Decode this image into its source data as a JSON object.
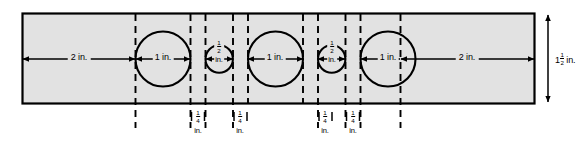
{
  "figure": {
    "type": "engineering-dimension-drawing",
    "plate": {
      "height_label_value": "1",
      "height_label_frac_num": "1",
      "height_label_frac_den": "2",
      "height_label_unit": "in.",
      "fill_color": "#e2e2e2",
      "stroke_color": "#000000"
    },
    "horizontal_dimensions": [
      {
        "id": "left-margin",
        "label": "2 in.",
        "value": 2,
        "unit": "in."
      },
      {
        "id": "hole-1",
        "label": "1 in.",
        "value": 1,
        "unit": "in."
      },
      {
        "id": "hole-2",
        "label": "",
        "frac_num": "1",
        "frac_den": "2",
        "unit": "in.",
        "value": 0.5
      },
      {
        "id": "hole-3",
        "label": "1 in.",
        "value": 1,
        "unit": "in."
      },
      {
        "id": "hole-4",
        "label": "",
        "frac_num": "1",
        "frac_den": "2",
        "unit": "in.",
        "value": 0.5
      },
      {
        "id": "hole-5",
        "label": "1 in.",
        "value": 1,
        "unit": "in."
      },
      {
        "id": "right-margin",
        "label": "2 in.",
        "value": 2,
        "unit": "in."
      }
    ],
    "gap_dimensions": [
      {
        "id": "gap-left",
        "frac_num": "1",
        "frac_den": "4",
        "unit": "in.",
        "value": 0.25
      },
      {
        "id": "gap-mid-left",
        "frac_num": "1",
        "frac_den": "4",
        "unit": "in.",
        "value": 0.25
      },
      {
        "id": "gap-mid-right",
        "frac_num": "1",
        "frac_den": "4",
        "unit": "in.",
        "value": 0.25
      },
      {
        "id": "gap-right",
        "frac_num": "1",
        "frac_den": "4",
        "unit": "in.",
        "value": 0.25
      }
    ],
    "circles": [
      {
        "id": "circle-1",
        "diameter": 1.0,
        "label": "1 in."
      },
      {
        "id": "circle-2",
        "diameter": 0.5,
        "label": "1/2 in."
      },
      {
        "id": "circle-3",
        "diameter": 1.0,
        "label": "1 in."
      },
      {
        "id": "circle-4",
        "diameter": 0.5,
        "label": "1/2 in."
      },
      {
        "id": "circle-5",
        "diameter": 1.0,
        "label": "1 in."
      }
    ],
    "unit_text": "in."
  }
}
